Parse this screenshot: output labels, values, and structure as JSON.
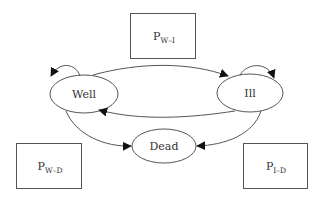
{
  "diagram": {
    "type": "state-transition",
    "states": [
      {
        "id": "well",
        "label": "Well"
      },
      {
        "id": "ill",
        "label": "Ill"
      },
      {
        "id": "dead",
        "label": "Dead"
      }
    ],
    "transitions": [
      {
        "from": "Well",
        "to": "Well"
      },
      {
        "from": "Well",
        "to": "Ill"
      },
      {
        "from": "Ill",
        "to": "Ill"
      },
      {
        "from": "Ill",
        "to": "Well"
      },
      {
        "from": "Well",
        "to": "Dead"
      },
      {
        "from": "Ill",
        "to": "Dead"
      }
    ],
    "probabilities": {
      "w_i": {
        "main": "P",
        "sub": "W–I"
      },
      "w_d": {
        "main": "P",
        "sub": "W–D"
      },
      "i_d": {
        "main": "P",
        "sub": "I–D"
      }
    },
    "colors": {
      "line": "#555555",
      "arrow": "#111111",
      "text": "#333333"
    }
  }
}
